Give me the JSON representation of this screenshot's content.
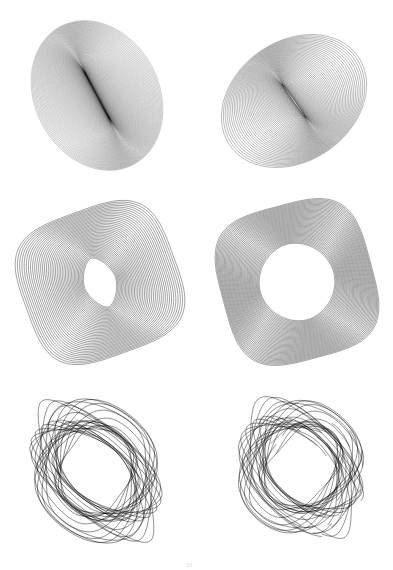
{
  "figure": {
    "background": "#ffffff",
    "stroke_color": "#000000",
    "page_mark": "15",
    "panels": [
      {
        "id": "a",
        "x": 22,
        "y": 18,
        "w": 150,
        "h": 155,
        "rotate": -28,
        "rx": 62,
        "ry": 78,
        "loops": 90,
        "shrink": 0.0,
        "inner": 0.02,
        "opacity": 0.35,
        "width": 0.5,
        "mode": "ellipse"
      },
      {
        "id": "b",
        "x": 216,
        "y": 28,
        "w": 156,
        "h": 146,
        "rotate": -35,
        "rx": 78,
        "ry": 60,
        "loops": 60,
        "shrink": 0.0,
        "inner": 0.12,
        "opacity": 0.45,
        "width": 0.55,
        "mode": "ellipse"
      },
      {
        "id": "c",
        "x": 20,
        "y": 205,
        "w": 160,
        "h": 155,
        "rotate": -20,
        "rx": 78,
        "ry": 74,
        "loops": 40,
        "shrink": 0.0,
        "inner": 0.35,
        "opacity": 0.55,
        "width": 0.6,
        "mode": "diamond"
      },
      {
        "id": "d",
        "x": 218,
        "y": 203,
        "w": 158,
        "h": 158,
        "rotate": -15,
        "rx": 76,
        "ry": 78,
        "loops": 40,
        "shrink": 0.0,
        "inner": 0.5,
        "opacity": 0.55,
        "width": 0.6,
        "mode": "square"
      },
      {
        "id": "e",
        "x": 22,
        "y": 392,
        "w": 148,
        "h": 158,
        "rotate": -8,
        "rx": 72,
        "ry": 78,
        "loops": 26,
        "shrink": 0.0,
        "inner": 0.6,
        "opacity": 0.6,
        "width": 0.7,
        "mode": "lissajous"
      },
      {
        "id": "f",
        "x": 226,
        "y": 392,
        "w": 150,
        "h": 150,
        "rotate": 0,
        "rx": 72,
        "ry": 72,
        "loops": 26,
        "shrink": 0.0,
        "inner": 0.6,
        "opacity": 0.6,
        "width": 0.7,
        "mode": "lissajous2"
      }
    ]
  }
}
